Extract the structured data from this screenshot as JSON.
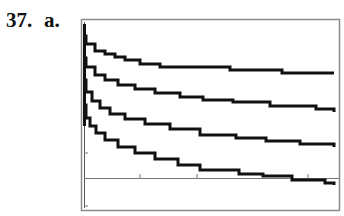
{
  "problem": {
    "number": "37.",
    "part": "a."
  },
  "chart_data": {
    "type": "line",
    "title": "",
    "xlabel": "",
    "ylabel": "",
    "grid": false,
    "legend": null,
    "x_ticks_px": [
      140,
      197,
      308
    ],
    "y_ticks_px": [
      153,
      206
    ],
    "series": [
      {
        "name": "curve-1",
        "points": [
          [
            84,
            36
          ],
          [
            86,
            44
          ],
          [
            95,
            51
          ],
          [
            105,
            54
          ],
          [
            115,
            57
          ],
          [
            125,
            60
          ],
          [
            140,
            64
          ],
          [
            160,
            67
          ],
          [
            200,
            67
          ],
          [
            230,
            70
          ],
          [
            282,
            73
          ],
          [
            334,
            73
          ]
        ]
      },
      {
        "name": "curve-2",
        "points": [
          [
            84,
            58
          ],
          [
            86,
            67
          ],
          [
            95,
            75
          ],
          [
            105,
            80
          ],
          [
            118,
            85
          ],
          [
            135,
            89
          ],
          [
            155,
            93
          ],
          [
            180,
            97
          ],
          [
            203,
            100
          ],
          [
            233,
            102
          ],
          [
            270,
            106
          ],
          [
            316,
            109
          ],
          [
            334,
            112
          ]
        ]
      },
      {
        "name": "curve-3",
        "points": [
          [
            84,
            80
          ],
          [
            86,
            92
          ],
          [
            92,
            101
          ],
          [
            100,
            108
          ],
          [
            110,
            114
          ],
          [
            125,
            119
          ],
          [
            145,
            124
          ],
          [
            170,
            129
          ],
          [
            200,
            135
          ],
          [
            210,
            135
          ],
          [
            236,
            138
          ],
          [
            266,
            141
          ],
          [
            300,
            144
          ],
          [
            334,
            147
          ]
        ]
      },
      {
        "name": "curve-4",
        "points": [
          [
            84,
            105
          ],
          [
            86,
            118
          ],
          [
            90,
            126
          ],
          [
            96,
            133
          ],
          [
            105,
            140
          ],
          [
            118,
            147
          ],
          [
            135,
            153
          ],
          [
            155,
            159
          ],
          [
            178,
            165
          ],
          [
            200,
            170
          ],
          [
            215,
            170
          ],
          [
            239,
            174
          ],
          [
            263,
            176
          ],
          [
            292,
            180
          ],
          [
            325,
            183
          ],
          [
            334,
            185
          ]
        ]
      }
    ]
  }
}
